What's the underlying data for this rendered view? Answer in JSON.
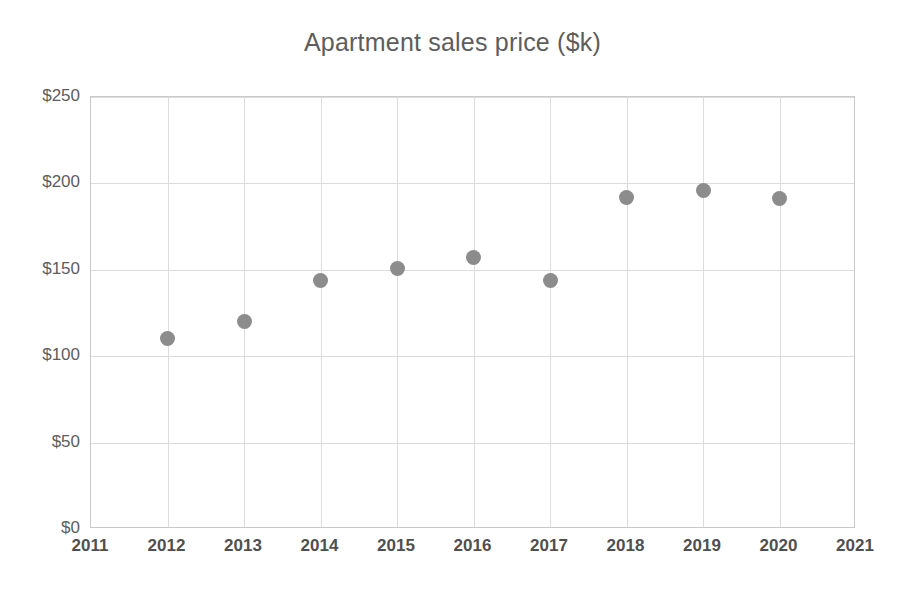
{
  "chart_data": {
    "type": "scatter",
    "title": "Apartment sales price ($k)",
    "xlabel": "",
    "ylabel": "",
    "x": [
      2012,
      2013,
      2014,
      2015,
      2016,
      2017,
      2018,
      2019,
      2020
    ],
    "values": [
      110,
      120,
      144,
      151,
      157,
      144,
      192,
      196,
      191
    ],
    "series": [
      {
        "name": "Apartment sales price",
        "values": [
          110,
          120,
          144,
          151,
          157,
          144,
          192,
          196,
          191
        ]
      }
    ],
    "points": [
      {
        "x": 2012,
        "y": 110
      },
      {
        "x": 2013,
        "y": 120
      },
      {
        "x": 2014,
        "y": 144
      },
      {
        "x": 2015,
        "y": 151
      },
      {
        "x": 2016,
        "y": 157
      },
      {
        "x": 2017,
        "y": 144
      },
      {
        "x": 2018,
        "y": 192
      },
      {
        "x": 2019,
        "y": 196
      },
      {
        "x": 2020,
        "y": 191
      }
    ],
    "xlim": [
      2011,
      2021
    ],
    "ylim": [
      0,
      250
    ],
    "x_tick_labels": [
      "2011",
      "2012",
      "2013",
      "2014",
      "2015",
      "2016",
      "2017",
      "2018",
      "2019",
      "2020",
      "2021"
    ],
    "x_ticks": [
      2011,
      2012,
      2013,
      2014,
      2015,
      2016,
      2017,
      2018,
      2019,
      2020,
      2021
    ],
    "y_tick_labels": [
      "$0",
      "$50",
      "$100",
      "$150",
      "$200",
      "$250"
    ],
    "y_ticks": [
      0,
      50,
      100,
      150,
      200,
      250
    ],
    "grid": true,
    "legend": false,
    "marker_color": "#8c8c8c",
    "grid_color": "#dcdcdc",
    "axis_color": "#c9c9c9",
    "text_color": "#5d5d5d"
  }
}
